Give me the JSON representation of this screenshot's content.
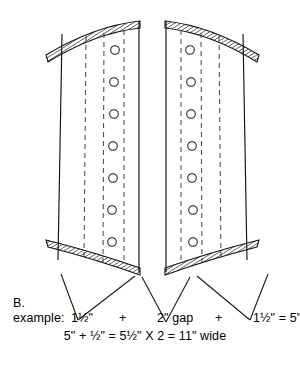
{
  "figure": {
    "label": "B.",
    "title_clipped": "",
    "boards": [
      {
        "name": "left-board",
        "circle_count": 7,
        "dashed_guide_count": 3,
        "crown_top": "hatched-curved-band",
        "crown_bottom": "hatched-curved-band"
      },
      {
        "name": "right-board",
        "circle_count": 7,
        "dashed_guide_count": 3,
        "crown_top": "hatched-curved-band",
        "crown_bottom": "hatched-curved-band"
      }
    ],
    "leader_lines": 3
  },
  "annotation": {
    "label": "B.",
    "line1": {
      "example_label": "example:",
      "measure_a": "1½\"",
      "plus_1": "+",
      "gap": "2\" gap",
      "plus_2": "+",
      "measure_b": "1½\" = 5\""
    },
    "line2": "5\" + ½\" = 5½\" X 2 = 11\" wide"
  },
  "colors": {
    "ink": "#000000",
    "hatch": "#333333",
    "dashed": "#555555",
    "background": "#ffffff"
  }
}
